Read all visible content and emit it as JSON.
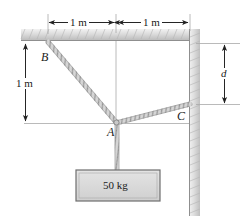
{
  "figure": {
    "background_color": "#ffffff"
  },
  "dimensions": {
    "top_left": {
      "label": "1 m",
      "name": "top-left-span"
    },
    "top_right": {
      "label": "1 m",
      "name": "top-right-span"
    },
    "left_vertical": {
      "label": "1 m",
      "name": "left-vertical-span"
    },
    "right_vertical": {
      "label": "d",
      "name": "right-vertical-span"
    }
  },
  "points": {
    "b": {
      "label": "B"
    },
    "a": {
      "label": "A"
    },
    "c": {
      "label": "C"
    }
  },
  "block": {
    "label": "50 kg",
    "fill": "#d9d9d9",
    "stroke": "#666666"
  },
  "colors": {
    "support_fill": "#d0d0d0",
    "cable_stroke": "#8a8a8a",
    "line_stroke": "#444444",
    "construction_stroke": "#999999"
  }
}
